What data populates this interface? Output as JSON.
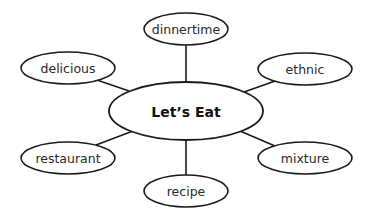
{
  "diagram": {
    "type": "word-web",
    "center": {
      "label": "Let’s Eat"
    },
    "nodes": [
      {
        "id": "dinnertime",
        "label": "dinnertime",
        "position": "top"
      },
      {
        "id": "delicious",
        "label": "delicious",
        "position": "upper-left"
      },
      {
        "id": "ethnic",
        "label": "ethnic",
        "position": "upper-right"
      },
      {
        "id": "restaurant",
        "label": "restaurant",
        "position": "lower-left"
      },
      {
        "id": "mixture",
        "label": "mixture",
        "position": "lower-right"
      },
      {
        "id": "recipe",
        "label": "recipe",
        "position": "bottom"
      }
    ],
    "colors": {
      "stroke": "#1a1a1a",
      "fill": "#ffffff",
      "text": "#2a2a2a",
      "center_text": "#111111",
      "background": "#ffffff"
    }
  }
}
